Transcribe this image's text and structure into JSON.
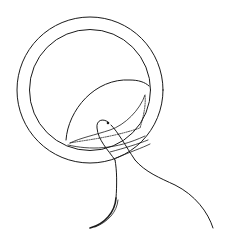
{
  "figure": {
    "type": "line-drawing",
    "stroke_color": "#1a1a1a",
    "background": "#ffffff",
    "parts": [
      {
        "name": "outer-ring",
        "shape": "circle"
      },
      {
        "name": "inner-ring",
        "shape": "circle"
      },
      {
        "name": "leaflet",
        "shape": "crescent"
      },
      {
        "name": "suture-loop",
        "shape": "curve"
      },
      {
        "name": "needle",
        "shape": "curved-needle"
      },
      {
        "name": "suture-tail",
        "shape": "curve"
      }
    ]
  }
}
